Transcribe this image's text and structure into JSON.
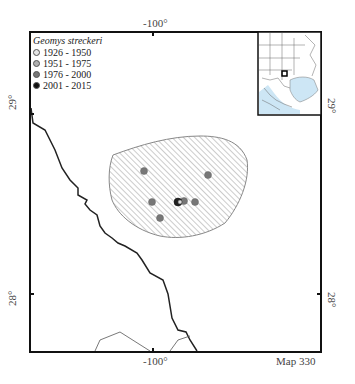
{
  "map": {
    "map_number_label": "Map 330",
    "species": "Geomys streckeri",
    "axes": {
      "top_longitude": "-100°",
      "bottom_longitude": "-100°",
      "left_lat_upper": "29°",
      "left_lat_lower": "28°",
      "right_lat_upper": "29°",
      "right_lat_lower": "28°"
    },
    "legend": {
      "title": "Geomys streckeri",
      "items": [
        {
          "label": "1926 - 1950",
          "color": "#e6e6e6"
        },
        {
          "label": "1951 - 1975",
          "color": "#b0b0b0"
        },
        {
          "label": "1976 - 2000",
          "color": "#777777"
        },
        {
          "label": "2001 - 2015",
          "color": "#111111"
        }
      ]
    },
    "range_polygon": {
      "fill_pattern": "diagonal-hatch",
      "stroke": "#888888"
    },
    "records": [
      {
        "x": 144,
        "y": 171,
        "period": "1976 - 2000"
      },
      {
        "x": 208,
        "y": 175,
        "period": "1976 - 2000"
      },
      {
        "x": 152,
        "y": 202,
        "period": "1976 - 2000"
      },
      {
        "x": 160,
        "y": 218,
        "period": "1976 - 2000"
      },
      {
        "x": 178,
        "y": 202,
        "period": "2001 - 2015"
      },
      {
        "x": 184,
        "y": 201,
        "period": "1976 - 2000"
      },
      {
        "x": 195,
        "y": 202,
        "period": "1976 - 2000"
      }
    ],
    "inset": {
      "land_color": "#ffffff",
      "water_color": "#cde6f5",
      "highlight": "study-area-box"
    }
  }
}
